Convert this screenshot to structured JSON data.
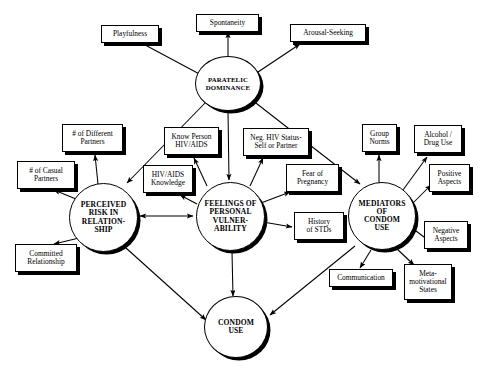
{
  "diagram": {
    "type": "conceptual-model-flow-diagram",
    "background_color": "#ffffff",
    "line_color": "#000000",
    "shadow_color": "#000000"
  },
  "nodes": {
    "paratelic_dominance": {
      "label": "PARATELIC\nDOMINANCE",
      "shape": "circle"
    },
    "playfulness": {
      "label": "Playfulness",
      "shape": "box"
    },
    "spontaneity": {
      "label": "Spontaneity",
      "shape": "box"
    },
    "arousal_seeking": {
      "label": "Arousal-Seeking",
      "shape": "box"
    },
    "perceived_risk": {
      "label": "PERCEIVED\nRISK IN\nRELATION-\nSHIP",
      "shape": "circle"
    },
    "different_partners": {
      "label": "# of Different\nPartners",
      "shape": "box"
    },
    "casual_partners": {
      "label": "# of Casual\nPartners",
      "shape": "box"
    },
    "committed_relationship": {
      "label": "Committed\nRelationship",
      "shape": "box"
    },
    "feelings_vulnerability": {
      "label": "FEELINGS OF\nPERSONAL\nVULNER-\nABILITY",
      "shape": "circle"
    },
    "know_person_hiv": {
      "label": "Know Person\nHIV/AIDS",
      "shape": "box"
    },
    "hiv_aids_knowledge": {
      "label": "HIV/AIDS\nKnowledge",
      "shape": "box"
    },
    "neg_hiv_status": {
      "label": "Neg. HIV Status-\nSelf or Partner",
      "shape": "box"
    },
    "fear_of_pregnancy": {
      "label": "Fear of\nPregnancy",
      "shape": "box"
    },
    "history_of_stds": {
      "label": "History\nof  STDs",
      "shape": "box"
    },
    "mediators_condom_use": {
      "label": "MEDIATORS\nOF\nCONDOM\nUSE",
      "shape": "circle"
    },
    "group_norms": {
      "label": "Group\nNorms",
      "shape": "box"
    },
    "alcohol_drug_use": {
      "label": "Alcohol /\nDrug Use",
      "shape": "box"
    },
    "positive_aspects": {
      "label": "Positive\nAspects",
      "shape": "box"
    },
    "negative_aspects": {
      "label": "Negative\nAspects",
      "shape": "box"
    },
    "communication": {
      "label": "Communication",
      "shape": "box"
    },
    "meta_motivational_states": {
      "label": "Meta-\nmotivational\nStates",
      "shape": "box"
    },
    "condom_use": {
      "label": "CONDOM\nUSE",
      "shape": "circle"
    }
  },
  "edges": [
    {
      "from": "paratelic_dominance",
      "to": "playfulness",
      "arrow": "single"
    },
    {
      "from": "paratelic_dominance",
      "to": "spontaneity",
      "arrow": "single"
    },
    {
      "from": "paratelic_dominance",
      "to": "arousal_seeking",
      "arrow": "single"
    },
    {
      "from": "paratelic_dominance",
      "to": "perceived_risk",
      "arrow": "single"
    },
    {
      "from": "paratelic_dominance",
      "to": "feelings_vulnerability",
      "arrow": "single"
    },
    {
      "from": "paratelic_dominance",
      "to": "mediators_condom_use",
      "arrow": "single"
    },
    {
      "from": "perceived_risk",
      "to": "different_partners",
      "arrow": "single"
    },
    {
      "from": "perceived_risk",
      "to": "casual_partners",
      "arrow": "single"
    },
    {
      "from": "perceived_risk",
      "to": "committed_relationship",
      "arrow": "single"
    },
    {
      "from": "perceived_risk",
      "to": "feelings_vulnerability",
      "arrow": "double"
    },
    {
      "from": "perceived_risk",
      "to": "condom_use",
      "arrow": "single"
    },
    {
      "from": "feelings_vulnerability",
      "to": "know_person_hiv",
      "arrow": "single"
    },
    {
      "from": "feelings_vulnerability",
      "to": "hiv_aids_knowledge",
      "arrow": "single"
    },
    {
      "from": "feelings_vulnerability",
      "to": "neg_hiv_status",
      "arrow": "single"
    },
    {
      "from": "feelings_vulnerability",
      "to": "fear_of_pregnancy",
      "arrow": "single"
    },
    {
      "from": "feelings_vulnerability",
      "to": "history_of_stds",
      "arrow": "single"
    },
    {
      "from": "feelings_vulnerability",
      "to": "condom_use",
      "arrow": "single"
    },
    {
      "from": "mediators_condom_use",
      "to": "group_norms",
      "arrow": "single"
    },
    {
      "from": "mediators_condom_use",
      "to": "alcohol_drug_use",
      "arrow": "single"
    },
    {
      "from": "mediators_condom_use",
      "to": "positive_aspects",
      "arrow": "single"
    },
    {
      "from": "mediators_condom_use",
      "to": "negative_aspects",
      "arrow": "single"
    },
    {
      "from": "mediators_condom_use",
      "to": "communication",
      "arrow": "single"
    },
    {
      "from": "mediators_condom_use",
      "to": "meta_motivational_states",
      "arrow": "single"
    },
    {
      "from": "mediators_condom_use",
      "to": "condom_use",
      "arrow": "single"
    }
  ]
}
